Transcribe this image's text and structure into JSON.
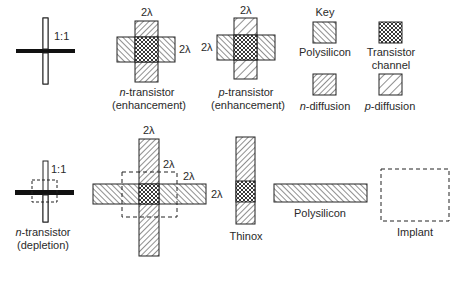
{
  "row1": {
    "stick_nmos": {
      "ratio_label": "1:1"
    },
    "n_transistor": {
      "dim_top": "2λ",
      "dim_right": "2λ",
      "label_prefix": "n",
      "label_rest": "-transistor",
      "label_line2": "(enhancement)"
    },
    "p_transistor": {
      "dim_top": "2λ",
      "dim_left": "2λ",
      "label_prefix": "p",
      "label_rest": "-transistor",
      "label_line2": "(enhancement)"
    },
    "key": {
      "title": "Key",
      "items": [
        {
          "name": "polysilicon",
          "label": "Polysilicon",
          "pattern": "hatch-backslash"
        },
        {
          "name": "transistor-channel",
          "label_line1": "Transistor",
          "label_line2": "channel",
          "pattern": "crosshatch"
        },
        {
          "name": "n-diffusion",
          "label_prefix": "n",
          "label_rest": "-diffusion",
          "pattern": "hatch-slash-dense"
        },
        {
          "name": "p-diffusion",
          "label_prefix": "p",
          "label_rest": "-diffusion",
          "pattern": "hatch-slash-sparse"
        }
      ]
    }
  },
  "row2": {
    "stick_depletion": {
      "ratio_label": "1:1",
      "label_prefix": "n",
      "label_rest": "-transistor",
      "label_line2": "(depletion)"
    },
    "depletion_layout": {
      "dim_top": "2λ",
      "dim_implant_top": "2λ",
      "dim_implant_right": "2λ",
      "dim_right": "2λ"
    },
    "thinox": {
      "label": "Thinox"
    },
    "polysilicon": {
      "label": "Polysilicon"
    },
    "implant": {
      "label": "Implant"
    }
  },
  "colors": {
    "line": "#222222",
    "background": "#ffffff"
  }
}
